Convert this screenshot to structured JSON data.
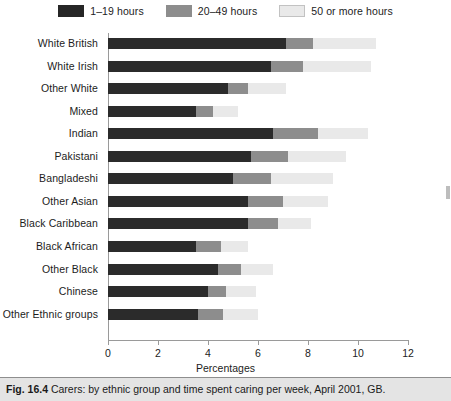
{
  "legend": {
    "items": [
      {
        "label": "1–19 hours",
        "color": "#262626",
        "key": "h1_19"
      },
      {
        "label": "20–49 hours",
        "color": "#8d8d8d",
        "key": "h20_49"
      },
      {
        "label": "50 or more hours",
        "color": "#e9e9e9",
        "key": "h50plus"
      }
    ]
  },
  "caption": {
    "figure_number": "Fig. 16.4",
    "text": "Carers: by ethnic group and time spent caring per week, April 2001, GB."
  },
  "chart_data": {
    "type": "bar",
    "orientation": "horizontal",
    "stacked": true,
    "title": "",
    "xlabel": "Percentages",
    "ylabel": "",
    "xlim": [
      0,
      12
    ],
    "xticks": [
      0,
      2,
      4,
      6,
      8,
      10,
      12
    ],
    "grid": false,
    "legend_position": "top-center",
    "categories": [
      "White British",
      "White Irish",
      "Other White",
      "Mixed",
      "Indian",
      "Pakistani",
      "Bangladeshi",
      "Other Asian",
      "Black Caribbean",
      "Black African",
      "Other Black",
      "Chinese",
      "Other Ethnic groups"
    ],
    "series": [
      {
        "name": "1–19 hours",
        "color": "#262626",
        "values": [
          7.1,
          6.5,
          4.8,
          3.5,
          6.6,
          5.7,
          5.0,
          5.6,
          5.6,
          3.5,
          4.4,
          4.0,
          3.6
        ]
      },
      {
        "name": "20–49 hours",
        "color": "#8d8d8d",
        "values": [
          1.1,
          1.3,
          0.8,
          0.7,
          1.8,
          1.5,
          1.5,
          1.4,
          1.2,
          1.0,
          0.9,
          0.7,
          1.0
        ]
      },
      {
        "name": "50 or more hours",
        "color": "#e9e9e9",
        "values": [
          2.5,
          2.7,
          1.5,
          1.0,
          2.0,
          2.3,
          2.5,
          1.8,
          1.3,
          1.1,
          1.3,
          1.2,
          1.4
        ]
      }
    ],
    "totals": [
      10.7,
      10.5,
      7.1,
      5.2,
      10.4,
      9.5,
      9.0,
      8.8,
      8.1,
      5.6,
      6.6,
      5.9,
      6.0
    ]
  }
}
